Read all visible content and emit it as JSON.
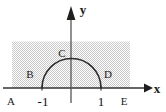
{
  "figure": {
    "background_color": "#ffffff",
    "stroke_color": "#333333",
    "shade_color": "#d8d8d8",
    "axes": {
      "x_axis_label": "x",
      "y_axis_label": "y",
      "x_axis_y_pixel": 88,
      "y_axis_x_pixel": 71,
      "origin_label": ""
    },
    "ticks": [
      {
        "name": "tick-neg-one",
        "label": "-1",
        "value": -1
      },
      {
        "name": "tick-one",
        "label": "1",
        "value": 1
      }
    ],
    "points": [
      {
        "name": "point-A",
        "label": "A"
      },
      {
        "name": "point-B",
        "label": "B"
      },
      {
        "name": "point-C",
        "label": "C"
      },
      {
        "name": "point-D",
        "label": "D"
      },
      {
        "name": "point-E",
        "label": "E"
      }
    ],
    "semicircle": {
      "name": "upper-half-unit-circle",
      "center_x": 1,
      "radius": 1,
      "description": "upper half of unit circle from -1 to 1"
    },
    "shaded_region": {
      "name": "shaded-rectangle",
      "description": "light gray dotted rectangle spanning above the x-axis"
    }
  }
}
